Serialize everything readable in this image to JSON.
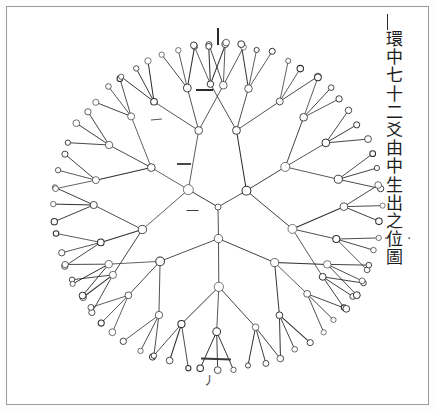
{
  "document": {
    "kind": "woodblock-diagram-plate",
    "background_color": "#ffffff",
    "frame_color": "#9a9a9a",
    "ink_color": "#2b2b2b"
  },
  "inscription": {
    "text": "環中七十二爻由中生出之位圖",
    "orientation": "vertical-right",
    "position": "top-right"
  },
  "annotations": {
    "top_tick": "|",
    "top_dash": "—",
    "mid_dash": "—",
    "left_dash": "—",
    "center_glyph": "一",
    "lower_dash": "—",
    "bottom_glyph": "丿",
    "right_dots": "· · ·"
  },
  "chart_data": {
    "type": "radial-tree",
    "title": "環中七十二爻由中生出之位圖",
    "center": {
      "x": 218,
      "y": 207
    },
    "branching_factor": 3,
    "depth": 4,
    "node_shape": "open-circle",
    "root_branch_angles_deg": [
      210,
      330,
      90
    ],
    "level_radii": [
      0,
      33,
      78,
      124,
      163
    ],
    "level_node_radius_px": [
      3.2,
      4.6,
      4.2,
      3.6,
      3.0
    ],
    "level_node_counts": [
      1,
      3,
      9,
      27,
      81
    ],
    "total_outer_nodes": 81,
    "nominal_line_count": 72,
    "angular_spread_deg": [
      0,
      46,
      17,
      6
    ],
    "stroke_color": "#2f2f2f",
    "stroke_width_px": 0.75,
    "grid": false,
    "legend": null
  }
}
